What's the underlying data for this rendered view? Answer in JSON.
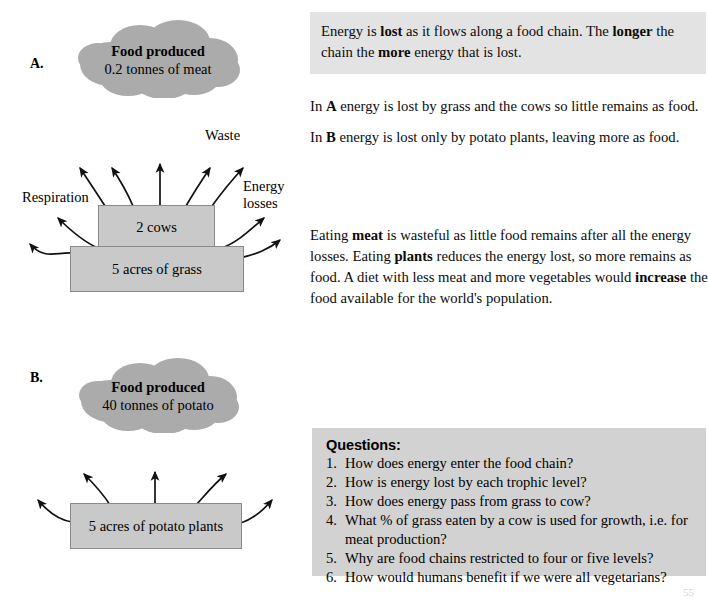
{
  "page": {
    "number": "55"
  },
  "sections": {
    "a": {
      "letter": "A.",
      "cloud": {
        "line1": "Food produced",
        "line2": "0.2 tonnes of meat"
      },
      "boxes": {
        "consumer": "2 cows",
        "producer": "5 acres of grass"
      },
      "labels": {
        "waste": "Waste",
        "respiration": "Respiration",
        "energy_losses": "Energy\nlosses"
      }
    },
    "b": {
      "letter": "B.",
      "cloud": {
        "line1": "Food produced",
        "line2": "40 tonnes of potato"
      },
      "boxes": {
        "producer": "5 acres of potato plants"
      }
    }
  },
  "text_blocks": {
    "intro": {
      "shaded": true,
      "html": "Energy is <b>lost</b> as it flows along a food chain. The <b>longer</b> the chain the <b>more</b> energy that is lost."
    },
    "note_a": {
      "html": "In <b>A</b> energy is lost by grass and the cows so little remains as food."
    },
    "note_b": {
      "html": "In <b>B</b> energy is lost only by potato plants, leaving more as food."
    },
    "summary": {
      "html": "Eating <b>meat</b> is wasteful as little food remains after all the energy losses. Eating <b>plants</b> reduces the energy lost, so more remains as food. A diet with less meat and more vegetables would <b>increase</b> the food available for the world's population."
    }
  },
  "questions": {
    "title": "Questions:",
    "items": [
      {
        "num": "1.",
        "text": "How does energy enter the food chain?"
      },
      {
        "num": "2.",
        "text": "How is energy lost by each trophic level?"
      },
      {
        "num": "3.",
        "text": "How does energy pass from grass to cow?"
      },
      {
        "num": "4.",
        "text": "What % of grass eaten by a cow is used for growth, i.e. for meat production?"
      },
      {
        "num": "5.",
        "text": "Why are food chains restricted to four or five levels?"
      },
      {
        "num": "6.",
        "text": "How would humans benefit if we were all vegetarians?"
      }
    ]
  },
  "colors": {
    "cloud_fill": "#ababab",
    "box_fill": "#c9c9c9",
    "box_border": "#8a8a8a",
    "shaded_text_bg": "#e3e3e3",
    "questions_bg": "#d2d2d2",
    "arrow_stroke": "#111111"
  }
}
